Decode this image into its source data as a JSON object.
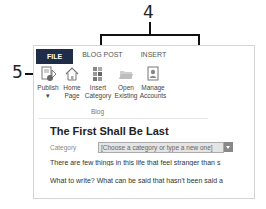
{
  "callouts": {
    "top": "4",
    "left": "5"
  },
  "tabs": [
    {
      "label": "FILE"
    },
    {
      "label": "BLOG POST"
    },
    {
      "label": "INSERT"
    }
  ],
  "ribbon": {
    "buttons": [
      {
        "line1": "Publish",
        "line2": "▾",
        "icon": "publish-icon"
      },
      {
        "line1": "Home",
        "line2": "Page",
        "icon": "home-icon"
      },
      {
        "line1": "Insert",
        "line2": "Category",
        "icon": "category-icon"
      },
      {
        "line1": "Open",
        "line2": "Existing",
        "icon": "folder-icon"
      },
      {
        "line1": "Manage",
        "line2": "Accounts",
        "icon": "account-icon"
      }
    ],
    "group_label": "Blog"
  },
  "post": {
    "title": "The First Shall Be Last",
    "category_label": "Category",
    "category_placeholder": "[Choose a category or type a new one]",
    "paragraphs": [
      "There are few things in this life that feel stranger than s",
      "What to write? What can be said that hasn't been said a"
    ]
  },
  "colors": {
    "file_tab": "#1f2d4a",
    "category_input_bg": "#e4e4e4"
  }
}
